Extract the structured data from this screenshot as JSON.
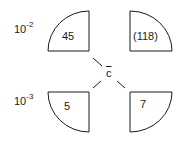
{
  "row_labels": {
    "top": {
      "base": "10",
      "exp": "-2"
    },
    "bottom": {
      "base": "10",
      "exp": "-3"
    }
  },
  "center_label": "c",
  "quadrants": [
    {
      "position": "top-left",
      "value": "45"
    },
    {
      "position": "top-right",
      "value": "(118)"
    },
    {
      "position": "bottom-left",
      "value": "5"
    },
    {
      "position": "bottom-right",
      "value": "7"
    }
  ],
  "colors": {
    "stroke": "#1a1a1a",
    "fill": "#ffffff"
  }
}
